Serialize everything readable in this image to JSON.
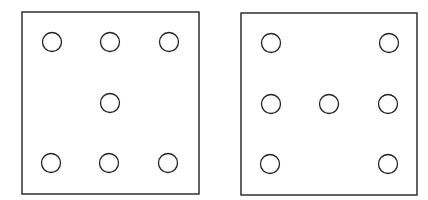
{
  "panels": [
    {
      "name": "left-panel",
      "box": {
        "x": 22,
        "y": 12,
        "w": 177,
        "h": 182
      },
      "circles": [
        {
          "cx": 52,
          "cy": 42
        },
        {
          "cx": 110,
          "cy": 42
        },
        {
          "cx": 169,
          "cy": 42
        },
        {
          "cx": 110,
          "cy": 103
        },
        {
          "cx": 51,
          "cy": 163
        },
        {
          "cx": 109,
          "cy": 163
        },
        {
          "cx": 168,
          "cy": 163
        }
      ]
    },
    {
      "name": "right-panel",
      "box": {
        "x": 241,
        "y": 13,
        "w": 176,
        "h": 182
      },
      "circles": [
        {
          "cx": 271,
          "cy": 43
        },
        {
          "cx": 389,
          "cy": 43
        },
        {
          "cx": 271,
          "cy": 104
        },
        {
          "cx": 329,
          "cy": 104
        },
        {
          "cx": 388,
          "cy": 104
        },
        {
          "cx": 270,
          "cy": 164
        },
        {
          "cx": 388,
          "cy": 164
        }
      ]
    }
  ],
  "style": {
    "stroke": "#222222",
    "circle_radius": 9.5
  }
}
